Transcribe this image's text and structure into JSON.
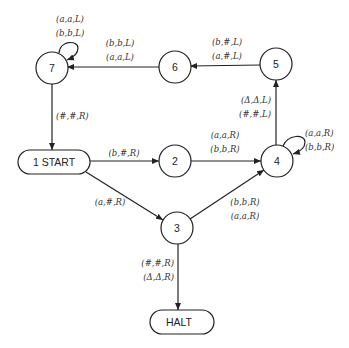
{
  "diagram": {
    "type": "turing-machine-state-diagram",
    "nodes": [
      {
        "id": "7",
        "label": "7",
        "shape": "circle",
        "cx": 52,
        "cy": 68
      },
      {
        "id": "6",
        "label": "6",
        "shape": "circle",
        "cx": 175,
        "cy": 67
      },
      {
        "id": "5",
        "label": "5",
        "shape": "circle",
        "cx": 276,
        "cy": 64
      },
      {
        "id": "start",
        "label": "1 START",
        "shape": "rounded-rect",
        "cx": 54,
        "cy": 162
      },
      {
        "id": "2",
        "label": "2",
        "shape": "circle",
        "cx": 175,
        "cy": 161
      },
      {
        "id": "4",
        "label": "4",
        "shape": "circle",
        "cx": 277,
        "cy": 161
      },
      {
        "id": "3",
        "label": "3",
        "shape": "circle",
        "cx": 177,
        "cy": 228
      },
      {
        "id": "halt",
        "label": "HALT",
        "shape": "rounded-rect",
        "cx": 179,
        "cy": 322
      }
    ],
    "edges": [
      {
        "from": "7",
        "to": "7",
        "labels": [
          "(a,a,L)",
          "(b,b,L)"
        ]
      },
      {
        "from": "6",
        "to": "7",
        "labels": [
          "(b,b,L)",
          "(a,a,L)"
        ]
      },
      {
        "from": "5",
        "to": "6",
        "labels": [
          "(b,#,L)",
          "(a,#,L)"
        ]
      },
      {
        "from": "7",
        "to": "start",
        "labels": [
          "(#,#,R)"
        ]
      },
      {
        "from": "start",
        "to": "2",
        "labels": [
          "(b,#,R)"
        ]
      },
      {
        "from": "start",
        "to": "3",
        "labels": [
          "(a,#,R)"
        ]
      },
      {
        "from": "2",
        "to": "4",
        "labels": [
          "(a,a,R)",
          "(b,b,R)"
        ]
      },
      {
        "from": "3",
        "to": "4",
        "labels": [
          "(b,b,R)",
          "(a,a,R)"
        ]
      },
      {
        "from": "4",
        "to": "4",
        "labels": [
          "(a,a,R)",
          "(b,b,R)"
        ]
      },
      {
        "from": "4",
        "to": "5",
        "labels": [
          "(Δ,Δ,L)",
          "(#,#,L)"
        ]
      },
      {
        "from": "3",
        "to": "halt",
        "labels": [
          "(#,#,R)",
          "(Δ,Δ,R)"
        ]
      }
    ]
  }
}
